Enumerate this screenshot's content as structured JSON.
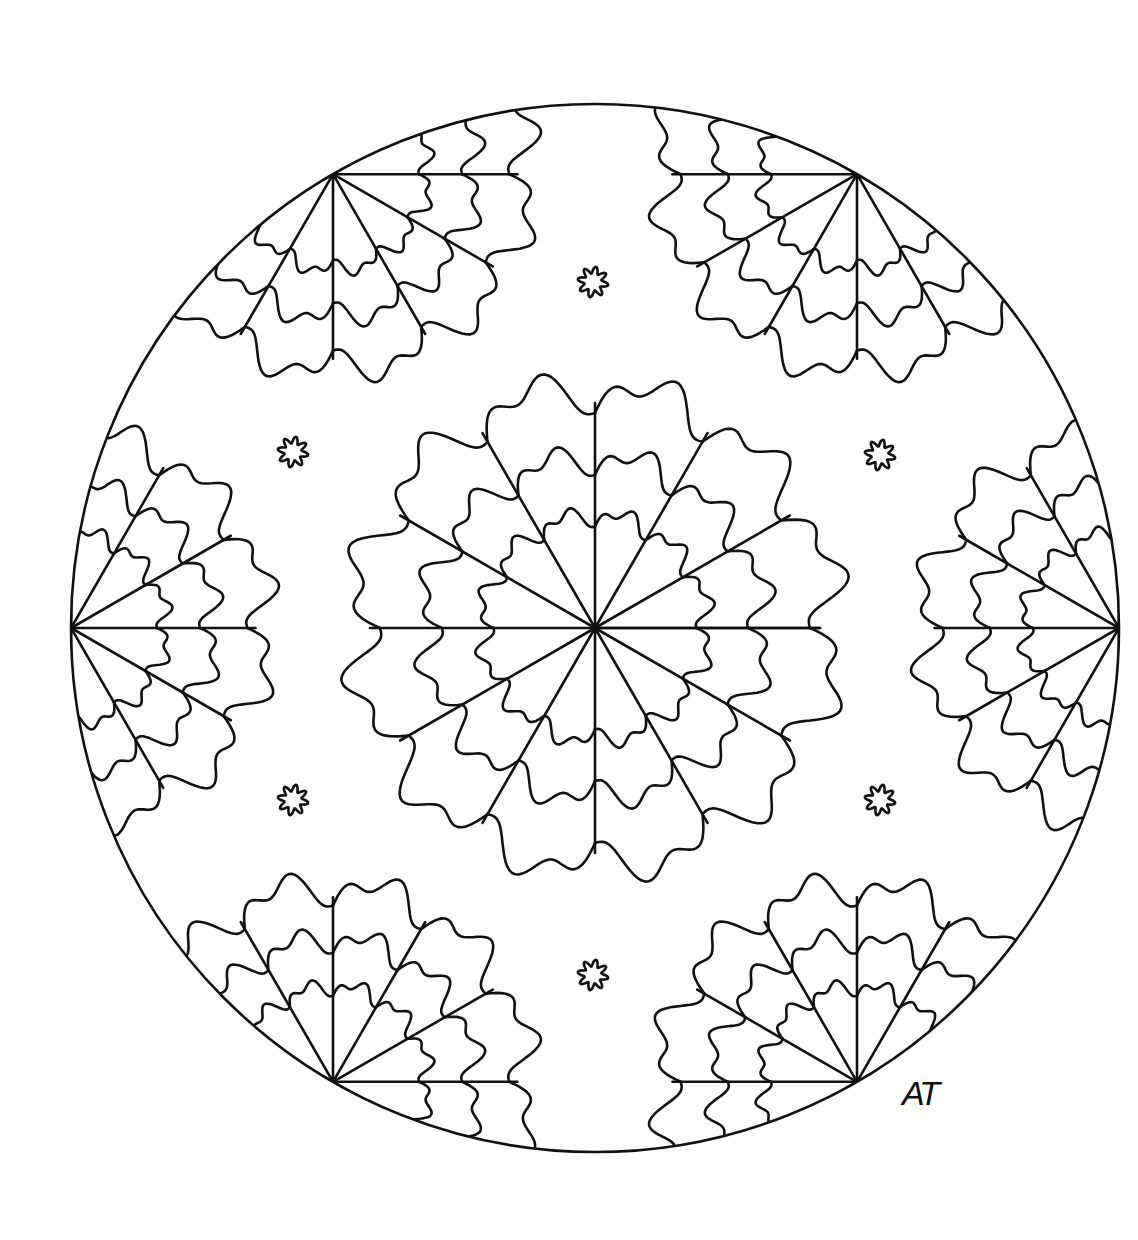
{
  "artwork": {
    "type": "mandala coloring page",
    "signature": "AT",
    "colors": {
      "line": "#111111",
      "background": "#ffffff"
    },
    "outer_circle": {
      "cx": 595,
      "cy": 628,
      "r": 524
    },
    "center_flower": {
      "cx": 595,
      "cy": 628,
      "spokes": 12,
      "rings": [
        118,
        178,
        250
      ]
    },
    "fans": [
      {
        "name": "fan-right",
        "angle_deg": 0
      },
      {
        "name": "fan-top-right",
        "angle_deg": -60
      },
      {
        "name": "fan-top-left",
        "angle_deg": -120
      },
      {
        "name": "fan-left",
        "angle_deg": 180
      },
      {
        "name": "fan-bottom-left",
        "angle_deg": 120
      },
      {
        "name": "fan-bottom-right",
        "angle_deg": 60
      }
    ],
    "fan_rings": [
      100,
      150,
      205
    ],
    "rosettes": [
      {
        "cx": 593,
        "cy": 282
      },
      {
        "cx": 293,
        "cy": 452
      },
      {
        "cx": 880,
        "cy": 455
      },
      {
        "cx": 293,
        "cy": 800
      },
      {
        "cx": 880,
        "cy": 800
      },
      {
        "cx": 593,
        "cy": 975
      }
    ]
  }
}
